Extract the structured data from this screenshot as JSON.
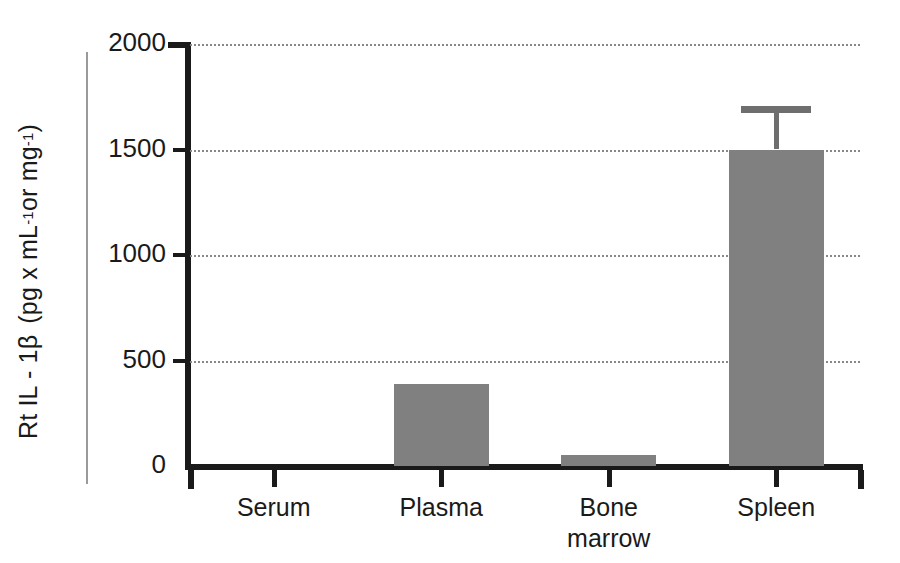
{
  "chart_data": {
    "type": "bar",
    "title": "",
    "xlabel": "",
    "ylabel": "Rt IL - 1β  (pg x mL⁻¹ or mg ⁻¹)",
    "ylabel_parts": {
      "analyte": "Rt IL - 1β",
      "units_open": "(pg x mL",
      "units_sup1": "-1",
      "units_mid": " or mg ",
      "units_sup2": "-1",
      "units_close": ")"
    },
    "categories": [
      "Serum",
      "Plasma",
      "Bone\nmarrow",
      "Spleen"
    ],
    "category_labels": [
      {
        "line1": "Serum",
        "line2": ""
      },
      {
        "line1": "Plasma",
        "line2": ""
      },
      {
        "line1": "Bone",
        "line2": "marrow"
      },
      {
        "line1": "Spleen",
        "line2": ""
      }
    ],
    "values": [
      0,
      390,
      50,
      1500
    ],
    "errors": [
      0,
      0,
      0,
      190
    ],
    "error_high": [
      0,
      0,
      0,
      1690
    ],
    "ylim": [
      0,
      2000
    ],
    "yticks": [
      0,
      500,
      1000,
      1500,
      2000
    ],
    "ytick_labels": [
      "0",
      "500",
      "1000",
      "1500",
      "2000"
    ],
    "grid": true,
    "grid_style": "dotted",
    "legend": "none",
    "bar_color": "#808080",
    "axis_color": "#1a1a1a",
    "grid_color": "#888888",
    "error_color": "#6e6e6e",
    "background": "#ffffff"
  }
}
